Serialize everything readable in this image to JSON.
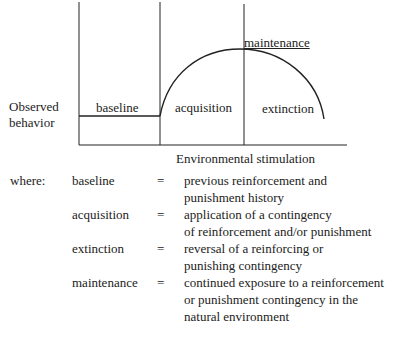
{
  "diagram": {
    "y_axis_label_line1": "Observed",
    "y_axis_label_line2": "behavior",
    "x_axis_label": "Environmental stimulation",
    "phases": {
      "baseline": "baseline",
      "acquisition": "acquisition",
      "maintenance": "maintenance",
      "extinction": "extinction"
    }
  },
  "legend": {
    "intro": "where:",
    "equals": "=",
    "entries": [
      {
        "term": "baseline",
        "line1": "previous reinforcement and",
        "line2": "punishment history"
      },
      {
        "term": "acquisition",
        "line1": "application of a contingency",
        "line2": "of reinforcement and/or punishment"
      },
      {
        "term": "extinction",
        "line1": "reversal of a reinforcing or",
        "line2": "punishing contingency"
      },
      {
        "term": "maintenance",
        "line1": "continued exposure to a reinforcement",
        "line2": "or punishment contingency in the",
        "line3": "natural environment"
      }
    ]
  }
}
